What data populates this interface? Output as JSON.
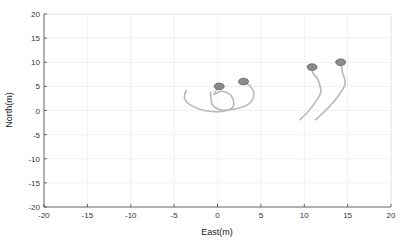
{
  "chart_data": {
    "type": "line",
    "title": "",
    "xlabel": "East(m)",
    "ylabel": "North(m)",
    "xlim": [
      -20,
      20
    ],
    "ylim": [
      -20,
      20
    ],
    "xticks": [
      -20,
      -15,
      -10,
      -5,
      0,
      5,
      10,
      15,
      20
    ],
    "yticks": [
      20,
      15,
      10,
      5,
      0,
      -5,
      -10,
      -15,
      -20
    ],
    "grid": true,
    "legend": null,
    "series": [
      {
        "name": "trajectory-1",
        "points": [
          [
            -3.6,
            4.2
          ],
          [
            -3.8,
            2.5
          ],
          [
            -3.0,
            1.0
          ],
          [
            -1.5,
            0.0
          ],
          [
            0.5,
            -0.2
          ],
          [
            1.8,
            0.8
          ],
          [
            1.6,
            3.0
          ],
          [
            0.5,
            4.0
          ],
          [
            -0.4,
            3.4
          ],
          [
            0.2,
            5.0
          ]
        ],
        "marker_end": [
          0.2,
          5.0
        ]
      },
      {
        "name": "trajectory-2",
        "points": [
          [
            -0.8,
            3.8
          ],
          [
            -0.6,
            1.2
          ],
          [
            0.5,
            0.1
          ],
          [
            2.0,
            0.3
          ],
          [
            3.5,
            1.2
          ],
          [
            4.2,
            3.2
          ],
          [
            3.8,
            5.0
          ],
          [
            3.0,
            6.0
          ]
        ],
        "marker_end": [
          3.0,
          6.0
        ]
      },
      {
        "name": "trajectory-3",
        "points": [
          [
            9.5,
            -1.9
          ],
          [
            10.4,
            -0.3
          ],
          [
            11.3,
            1.8
          ],
          [
            11.9,
            3.8
          ],
          [
            11.6,
            6.3
          ],
          [
            11.0,
            7.8
          ],
          [
            10.9,
            9.0
          ]
        ],
        "marker_end": [
          10.9,
          9.0
        ]
      },
      {
        "name": "trajectory-4",
        "points": [
          [
            11.3,
            -1.9
          ],
          [
            12.4,
            -0.1
          ],
          [
            13.7,
            2.5
          ],
          [
            14.7,
            5.4
          ],
          [
            14.4,
            8.0
          ],
          [
            14.2,
            10.0
          ]
        ],
        "marker_end": [
          14.2,
          10.0
        ]
      }
    ],
    "colors": {
      "line": "#b8b8b8",
      "marker_fill": "#8c8c8c",
      "marker_edge": "#5a5a5a",
      "grid": "#ececec",
      "axis": "#444444"
    }
  }
}
